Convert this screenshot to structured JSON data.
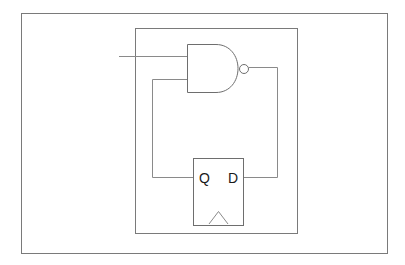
{
  "diagram": {
    "type": "logic-circuit",
    "colors": {
      "background": "#ffffff",
      "frame": "#7a7a7a",
      "wire": "#8a8a8a",
      "gate": "#6e6e6e",
      "text": "#1a1a1a"
    },
    "components": {
      "nand_gate": {
        "label": "",
        "inputs": [
          "external-input",
          "feedback-from-Q"
        ],
        "output": "to-D"
      },
      "flip_flop": {
        "type": "D flip-flop",
        "pins": {
          "q_label": "Q",
          "d_label": "D"
        },
        "has_clock": true
      }
    },
    "connections": [
      {
        "from": "external-input",
        "to": "nand_gate.input1"
      },
      {
        "from": "nand_gate.output",
        "to": "flip_flop.D"
      },
      {
        "from": "flip_flop.Q",
        "to": "nand_gate.input2"
      }
    ]
  }
}
